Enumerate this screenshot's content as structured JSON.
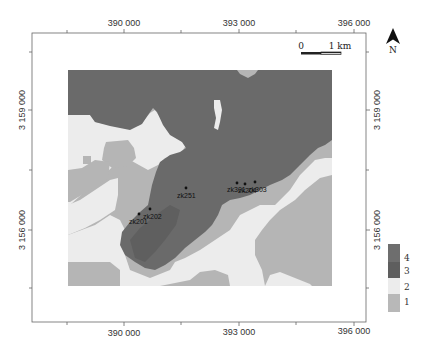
{
  "map": {
    "x_axis": {
      "top_labels": [
        "390 000",
        "393 000",
        "396 000"
      ],
      "bottom_labels": [
        "390 000",
        "393 000",
        "396 000"
      ]
    },
    "y_axis": {
      "left_labels": [
        "3 159 000",
        "3 156 000"
      ],
      "right_labels": [
        "3 159 000",
        "3 156 000"
      ]
    },
    "scale_bar": {
      "start": "0",
      "end": "1 km"
    },
    "north_arrow": {
      "label": "N"
    },
    "legend": {
      "items": [
        {
          "label": "4",
          "color": "#6e6e6e"
        },
        {
          "label": "3",
          "color": "#5e5e5e"
        },
        {
          "label": "2",
          "color": "#ececec"
        },
        {
          "label": "1",
          "color": "#b8b8b8"
        }
      ]
    },
    "wells": [
      {
        "label": "zk251"
      },
      {
        "label": "zk202"
      },
      {
        "label": "zk201"
      },
      {
        "label": "zk301"
      },
      {
        "label": "zk204"
      },
      {
        "label": "zk303"
      }
    ],
    "colors": {
      "class4": "#6a6a6a",
      "class3": "#5e5e5e",
      "class2": "#ececec",
      "class1": "#b5b5b5",
      "frame": "#555555"
    }
  }
}
